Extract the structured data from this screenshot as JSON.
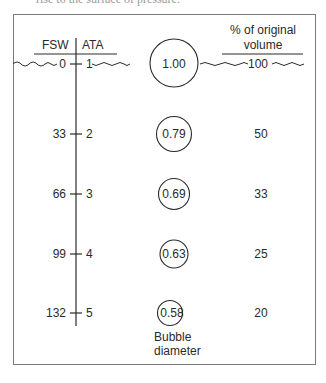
{
  "caption": "rise to the surface of pressure.",
  "headers": {
    "fsw": "FSW",
    "ata": "ATA",
    "volume_line1": "% of original",
    "volume_line2": "volume"
  },
  "rows": [
    {
      "fsw": "0",
      "ata": "1",
      "diameter": "1.00",
      "volume": "100"
    },
    {
      "fsw": "33",
      "ata": "2",
      "diameter": "0.79",
      "volume": "50"
    },
    {
      "fsw": "66",
      "ata": "3",
      "diameter": "0.69",
      "volume": "33"
    },
    {
      "fsw": "99",
      "ata": "4",
      "diameter": "0.63",
      "volume": "25"
    },
    {
      "fsw": "132",
      "ata": "5",
      "diameter": "0.58",
      "volume": "20"
    }
  ],
  "footer": {
    "line1": "Bubble",
    "line2": "diameter"
  },
  "colors": {
    "ink": "#2a2a2a",
    "frame": "#7a7a7a"
  }
}
